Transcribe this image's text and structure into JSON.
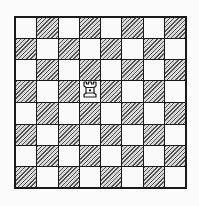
{
  "board": {
    "size": 8,
    "top_left_color": "light",
    "colors": {
      "light": "#fafafa",
      "dark_hatch": "#555555",
      "border": "#1a1a1a"
    },
    "pieces": [
      {
        "type": "rook",
        "color": "white",
        "row": 3,
        "col": 3,
        "square": "d5",
        "icon": "white-rook-icon"
      }
    ]
  }
}
